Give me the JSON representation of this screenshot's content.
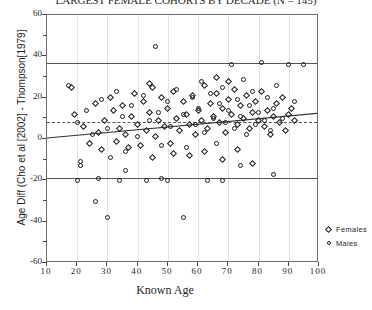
{
  "title": "LARGEST FEMALE COHORTS BY DECADE (N = 145)",
  "axes": {
    "x": {
      "label": "Known Age",
      "min": 10,
      "max": 100,
      "ticks": [
        10,
        20,
        30,
        40,
        50,
        60,
        70,
        80,
        90,
        100
      ]
    },
    "y": {
      "label": "Age Diff (Cho et al [2002] - Thompson[1979]",
      "min": -60,
      "max": 60,
      "ticks": [
        60,
        40,
        20,
        0,
        -20,
        -40,
        -60
      ]
    }
  },
  "legend": {
    "position": "right",
    "entries": [
      {
        "label": "Females",
        "marker": "diamond-open-icon"
      },
      {
        "label": "Males",
        "marker": "circle-open-icon"
      }
    ]
  },
  "reference_lines": [
    {
      "name": "upper-limit-of-agreement",
      "y": 37,
      "style": "solid"
    },
    {
      "name": "mean-difference",
      "y": 8,
      "style": "dashed"
    },
    {
      "name": "lower-limit-of-agreement",
      "y": -19,
      "style": "solid"
    }
  ],
  "trend_line": {
    "name": "regression-line",
    "x0": 10,
    "y0": 0.5,
    "x1": 100,
    "y1": 12.5
  },
  "chart_data": {
    "type": "scatter",
    "title": "LARGEST FEMALE COHORTS BY DECADE (N = 145)",
    "xlabel": "Known Age",
    "ylabel": "Age Diff (Cho et al [2002] - Thompson[1979]",
    "xlim": [
      10,
      100
    ],
    "ylim": [
      -60,
      60
    ],
    "xticks": [
      10,
      20,
      30,
      40,
      50,
      60,
      70,
      80,
      90,
      100
    ],
    "yticks": [
      -60,
      -40,
      -20,
      0,
      20,
      40,
      60
    ],
    "grid": "vertical",
    "legend_position": "right",
    "series": [
      {
        "name": "Females",
        "marker": "diamond-open",
        "points": [
          [
            18,
            25
          ],
          [
            19,
            12
          ],
          [
            22,
            6
          ],
          [
            24,
            -2
          ],
          [
            26,
            17
          ],
          [
            27,
            3
          ],
          [
            28,
            -5
          ],
          [
            29,
            9
          ],
          [
            31,
            20
          ],
          [
            32,
            14
          ],
          [
            33,
            -1
          ],
          [
            34,
            5
          ],
          [
            35,
            16
          ],
          [
            36,
            2
          ],
          [
            37,
            -4
          ],
          [
            38,
            11
          ],
          [
            39,
            22
          ],
          [
            40,
            7
          ],
          [
            41,
            -3
          ],
          [
            42,
            18
          ],
          [
            43,
            4
          ],
          [
            44,
            13
          ],
          [
            45,
            25
          ],
          [
            46,
            1
          ],
          [
            47,
            9
          ],
          [
            48,
            20
          ],
          [
            49,
            6
          ],
          [
            50,
            15
          ],
          [
            51,
            -2
          ],
          [
            52,
            23
          ],
          [
            53,
            10
          ],
          [
            54,
            4
          ],
          [
            55,
            18
          ],
          [
            56,
            12
          ],
          [
            57,
            7
          ],
          [
            58,
            21
          ],
          [
            59,
            2
          ],
          [
            60,
            14
          ],
          [
            61,
            9
          ],
          [
            62,
            26
          ],
          [
            63,
            5
          ],
          [
            64,
            17
          ],
          [
            65,
            11
          ],
          [
            66,
            22
          ],
          [
            67,
            8
          ],
          [
            68,
            15
          ],
          [
            69,
            3
          ],
          [
            70,
            19
          ],
          [
            71,
            12
          ],
          [
            72,
            24
          ],
          [
            73,
            7
          ],
          [
            74,
            16
          ],
          [
            75,
            10
          ],
          [
            76,
            21
          ],
          [
            77,
            5
          ],
          [
            78,
            13
          ],
          [
            79,
            18
          ],
          [
            80,
            9
          ],
          [
            81,
            23
          ],
          [
            82,
            6
          ],
          [
            83,
            14
          ],
          [
            84,
            2
          ],
          [
            85,
            11
          ],
          [
            86,
            17
          ],
          [
            87,
            8
          ],
          [
            88,
            20
          ],
          [
            89,
            4
          ],
          [
            90,
            12
          ],
          [
            91,
            15
          ],
          [
            92,
            9
          ],
          [
            57,
            -8
          ],
          [
            62,
            -6
          ],
          [
            68,
            -10
          ],
          [
            73,
            -5
          ],
          [
            78,
            -12
          ],
          [
            45,
            -9
          ],
          [
            52,
            -7
          ],
          [
            66,
            30
          ],
          [
            70,
            28
          ],
          [
            44,
            27
          ]
        ]
      },
      {
        "name": "Males",
        "marker": "circle-open",
        "points": [
          [
            17,
            26
          ],
          [
            20,
            8
          ],
          [
            21,
            -11
          ],
          [
            23,
            14
          ],
          [
            25,
            2
          ],
          [
            28,
            19
          ],
          [
            30,
            5
          ],
          [
            31,
            -9
          ],
          [
            33,
            23
          ],
          [
            35,
            11
          ],
          [
            36,
            -6
          ],
          [
            38,
            16
          ],
          [
            40,
            1
          ],
          [
            42,
            21
          ],
          [
            44,
            9
          ],
          [
            46,
            45
          ],
          [
            47,
            13
          ],
          [
            48,
            -3
          ],
          [
            50,
            18
          ],
          [
            51,
            6
          ],
          [
            53,
            24
          ],
          [
            55,
            12
          ],
          [
            56,
            -4
          ],
          [
            58,
            20
          ],
          [
            59,
            7
          ],
          [
            60,
            15
          ],
          [
            61,
            28
          ],
          [
            62,
            3
          ],
          [
            64,
            22
          ],
          [
            65,
            10
          ],
          [
            66,
            -2
          ],
          [
            67,
            17
          ],
          [
            68,
            25
          ],
          [
            69,
            8
          ],
          [
            70,
            14
          ],
          [
            71,
            36
          ],
          [
            72,
            5
          ],
          [
            73,
            19
          ],
          [
            74,
            11
          ],
          [
            75,
            29
          ],
          [
            76,
            2
          ],
          [
            77,
            16
          ],
          [
            78,
            23
          ],
          [
            79,
            7
          ],
          [
            80,
            13
          ],
          [
            81,
            37
          ],
          [
            82,
            9
          ],
          [
            83,
            20
          ],
          [
            84,
            4
          ],
          [
            85,
            15
          ],
          [
            86,
            26
          ],
          [
            88,
            10
          ],
          [
            90,
            36
          ],
          [
            92,
            18
          ],
          [
            95,
            36
          ],
          [
            20,
            -20
          ],
          [
            26,
            -30
          ],
          [
            34,
            -20
          ],
          [
            43,
            -20
          ],
          [
            50,
            -20
          ],
          [
            55,
            -38
          ],
          [
            63,
            -20
          ],
          [
            68,
            -20
          ],
          [
            74,
            -13
          ],
          [
            30,
            -38
          ],
          [
            21,
            -13
          ],
          [
            85,
            -17
          ],
          [
            27,
            -19
          ],
          [
            36,
            -15
          ],
          [
            48,
            -19
          ]
        ]
      }
    ]
  }
}
